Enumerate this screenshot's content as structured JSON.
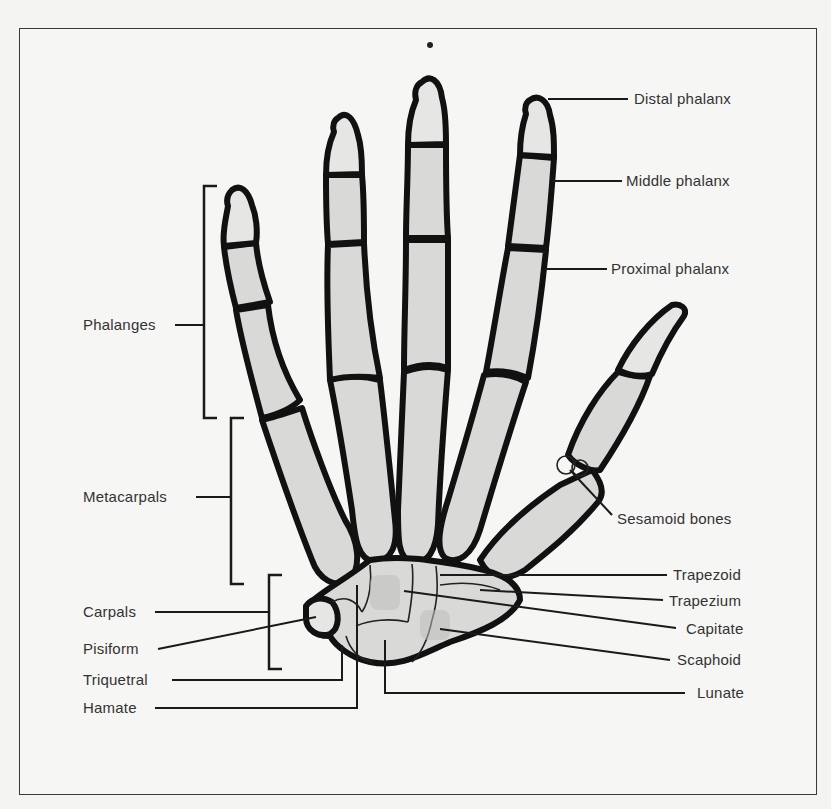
{
  "figure": {
    "labels_left": [
      {
        "id": "phalanges",
        "text": "Phalanges"
      },
      {
        "id": "metacarpals",
        "text": "Metacarpals"
      },
      {
        "id": "carpals",
        "text": "Carpals"
      },
      {
        "id": "pisiform",
        "text": "Pisiform"
      },
      {
        "id": "triquetral",
        "text": "Triquetral"
      },
      {
        "id": "hamate",
        "text": "Hamate"
      }
    ],
    "labels_right": [
      {
        "id": "distal-phalanx",
        "text": "Distal phalanx"
      },
      {
        "id": "middle-phalanx",
        "text": "Middle phalanx"
      },
      {
        "id": "proximal-phalanx",
        "text": "Proximal phalanx"
      },
      {
        "id": "sesamoid-bones",
        "text": "Sesamoid bones"
      },
      {
        "id": "trapezoid",
        "text": "Trapezoid"
      },
      {
        "id": "trapezium",
        "text": "Trapezium"
      },
      {
        "id": "capitate",
        "text": "Capitate"
      },
      {
        "id": "scaphoid",
        "text": "Scaphoid"
      },
      {
        "id": "lunate",
        "text": "Lunate"
      }
    ]
  }
}
